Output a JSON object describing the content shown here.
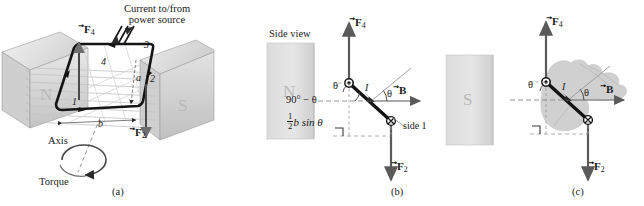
{
  "figure": {
    "background_color": "#ffffff",
    "ink_color": "#1a1a1a",
    "magnet_fill": "#d9d9d9",
    "field_line_color": "#bdbdbd",
    "hand_fill": "#cfcfcf",
    "width": 644,
    "height": 206
  },
  "panel_a": {
    "caption": "(a)",
    "current_note_line1": "Current to/from",
    "current_note_line2": "power source",
    "pole_north": "N",
    "pole_south": "S",
    "axis_label": "Axis",
    "torque_label": "Torque",
    "force_f4": "F",
    "force_f4_sub": "4",
    "force_f2": "F",
    "force_f2_sub": "2",
    "side_1": "1",
    "side_2": "2",
    "side_3": "3",
    "side_4": "4",
    "dim_a": "a",
    "dim_b": "b"
  },
  "panel_b": {
    "caption": "(b)",
    "side_view_label": "Side view",
    "pole_north": "N",
    "force_f4": "F",
    "force_f4_sub": "4",
    "force_f2": "F",
    "force_f2_sub": "2",
    "field_b": "B",
    "current_i": "I",
    "theta_top": "θ",
    "theta_right": "θ",
    "angle_complement": "90° − θ",
    "moment_arm_num": "1",
    "moment_arm_den": "2",
    "moment_arm_rest": "b sin θ",
    "side_1_label": "side 1"
  },
  "panel_c": {
    "caption": "(c)",
    "pole_south": "S",
    "force_f4": "F",
    "force_f4_sub": "4",
    "force_f2": "F",
    "force_f2_sub": "2",
    "field_b": "B",
    "current_i": "I",
    "theta_left": "θ",
    "theta_right": "θ",
    "hand_note": "right-hand-rule hand silhouette"
  }
}
